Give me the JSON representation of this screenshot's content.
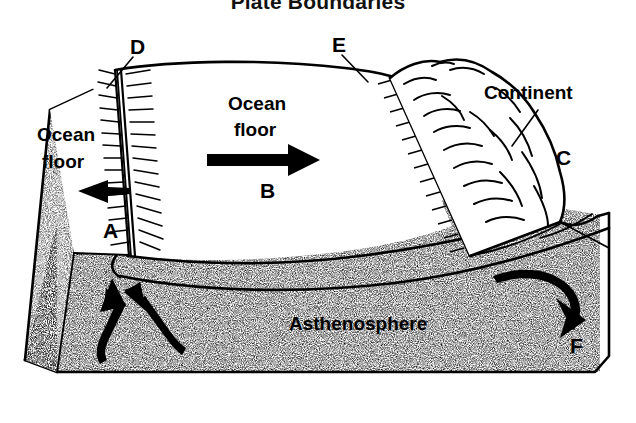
{
  "title": "Plate Boundaries",
  "diagram": {
    "type": "geology-block-diagram",
    "background_color": "#ffffff",
    "ink_color": "#000000"
  },
  "labels": {
    "title": "Plate Boundaries",
    "ocean_floor_left_line1": "Ocean",
    "ocean_floor_left_line2": "floor",
    "ocean_floor_center_line1": "Ocean",
    "ocean_floor_center_line2": "floor",
    "continent": "Continent",
    "asthenosphere": "Asthenosphere",
    "letter_a": "A",
    "letter_b": "B",
    "letter_c": "C",
    "letter_d": "D",
    "letter_e": "E",
    "letter_f": "F"
  },
  "annotations": [
    {
      "key": "A",
      "text": "A",
      "refers_to": "oceanic plate moving left away from ridge",
      "x": 110,
      "y": 231
    },
    {
      "key": "B",
      "text": "B",
      "refers_to": "oceanic plate moving right away from ridge",
      "x": 268,
      "y": 190
    },
    {
      "key": "C",
      "text": "C",
      "refers_to": "continental plate / continent",
      "x": 563,
      "y": 157
    },
    {
      "key": "D",
      "text": "D",
      "refers_to": "mid-ocean ridge divergent boundary",
      "x": 138,
      "y": 47
    },
    {
      "key": "E",
      "text": "E",
      "refers_to": "trench convergent subduction boundary",
      "x": 340,
      "y": 45
    },
    {
      "key": "F",
      "text": "F",
      "refers_to": "subducting slab descending into mantle",
      "x": 578,
      "y": 345
    }
  ],
  "features": [
    {
      "name": "mid-ocean-ridge",
      "label": "D",
      "description": "double ridge crest line with radiating hatch marks"
    },
    {
      "name": "spreading-arrow-left",
      "label": "Ocean floor",
      "direction": "left"
    },
    {
      "name": "spreading-arrow-right",
      "label": "Ocean floor",
      "direction": "right"
    },
    {
      "name": "trench-subduction-zone",
      "label": "E",
      "description": "toothed convergent boundary at continental margin"
    },
    {
      "name": "continent-mountains",
      "label": "Continent",
      "description": "folded mountain range on right"
    },
    {
      "name": "asthenosphere",
      "label": "Asthenosphere",
      "description": "stippled mantle region beneath lithosphere"
    },
    {
      "name": "mantle-upwelling-arrows",
      "count": 2,
      "direction": "up",
      "description": "convection rising beneath ridge"
    },
    {
      "name": "slab-descent-arrow",
      "label": "F",
      "direction": "down-right",
      "description": "convection descending at trench"
    }
  ]
}
